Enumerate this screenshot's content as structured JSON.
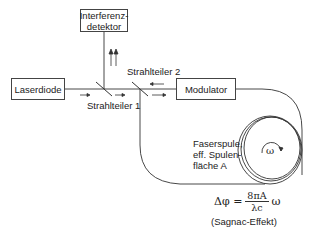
{
  "diagram": {
    "components": {
      "detector": {
        "line1": "Interferenz-",
        "line2": "detektor"
      },
      "laser": "Laserdiode",
      "modulator": "Modulator",
      "splitter1": "Strahlteiler 1",
      "splitter2": "Strahlteiler 2",
      "coil": {
        "line1": "Faserspule,",
        "line2": "eff. Spulen-",
        "line3": "fläche A"
      },
      "rotation_symbol": "ω"
    },
    "formula": {
      "lhs": "Δφ =",
      "numerator": "8πA",
      "denominator": "λc",
      "rhs": "ω",
      "caption": "(Sagnac-Effekt)"
    },
    "colors": {
      "line": "#333333",
      "text": "#222222",
      "background": "#ffffff"
    }
  }
}
